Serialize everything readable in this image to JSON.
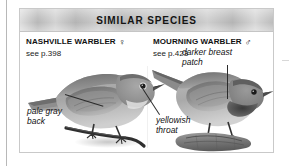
{
  "panel": {
    "header": {
      "title": "SIMILAR SPECIES"
    },
    "species": [
      {
        "name": "NASHVILLE WARBLER",
        "sex_symbol": "♀",
        "sex_name": "female-symbol",
        "page_reference": "see p.398"
      },
      {
        "name": "MOURNING WARBLER",
        "sex_symbol": "♂",
        "sex_name": "male-symbol",
        "page_reference": "see p.423"
      }
    ],
    "callouts": [
      {
        "id": "pale-gray-back",
        "text": "pale gray back"
      },
      {
        "id": "yellowish-throat",
        "text": "yellowish throat"
      },
      {
        "id": "darker-breast-patch",
        "text": "darker breast patch"
      }
    ],
    "illustrations": [
      {
        "id": "nashville-warbler-illustration",
        "subject": "perched warbler facing right on twig"
      },
      {
        "id": "mourning-warbler-illustration",
        "subject": "perched warbler facing right on log"
      }
    ]
  },
  "colors": {
    "header_band": "#bdbdbd",
    "panel_border": "#c9c9c9",
    "text": "#121212",
    "background": "#ffffff"
  }
}
